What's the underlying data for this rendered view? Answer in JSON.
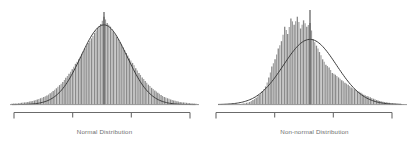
{
  "figure": {
    "background_color": "#ffffff",
    "bar_color": "#8a8a8a",
    "curve_color": "#3d3d3d",
    "axis_color": "#6b6b6b",
    "mean_line_color": "#4a4a4a",
    "caption_color": "#6e6e6e"
  },
  "panels": [
    {
      "id": "normal",
      "caption": "Normal Distribution",
      "axis": {
        "ticks": 2,
        "end_caps": true
      }
    },
    {
      "id": "non-normal",
      "caption": "Non-normal Distribution",
      "axis": {
        "ticks": 2,
        "end_caps": true
      }
    }
  ],
  "chart_data": [
    {
      "type": "bar",
      "title": "Normal Distribution",
      "xlabel": "",
      "ylabel": "",
      "grid": false,
      "legend": "none",
      "overlay_curve": "normal",
      "mean_line_x": 0,
      "xlim": [
        -4,
        4
      ],
      "ylim": [
        0,
        1
      ],
      "x": [
        -4.0,
        -3.86,
        -3.72,
        -3.59,
        -3.45,
        -3.31,
        -3.17,
        -3.03,
        -2.9,
        -2.76,
        -2.62,
        -2.48,
        -2.34,
        -2.21,
        -2.07,
        -1.93,
        -1.79,
        -1.66,
        -1.52,
        -1.38,
        -1.24,
        -1.1,
        -0.97,
        -0.83,
        -0.69,
        -0.55,
        -0.41,
        -0.28,
        -0.14,
        0.0,
        0.14,
        0.28,
        0.41,
        0.55,
        0.69,
        0.83,
        0.97,
        1.1,
        1.24,
        1.38,
        1.52,
        1.66,
        1.79,
        1.93,
        2.07,
        2.21,
        2.34,
        2.48,
        2.62,
        2.76,
        2.9,
        3.03,
        3.17,
        3.31,
        3.45,
        3.59,
        3.72,
        3.86,
        4.0
      ],
      "values": [
        0.01,
        0.012,
        0.015,
        0.02,
        0.024,
        0.03,
        0.037,
        0.046,
        0.056,
        0.07,
        0.085,
        0.1,
        0.125,
        0.15,
        0.18,
        0.215,
        0.25,
        0.295,
        0.34,
        0.39,
        0.45,
        0.5,
        0.56,
        0.62,
        0.68,
        0.73,
        0.79,
        0.85,
        0.89,
        0.97,
        0.9,
        0.86,
        0.8,
        0.75,
        0.69,
        0.63,
        0.57,
        0.51,
        0.46,
        0.4,
        0.35,
        0.3,
        0.26,
        0.22,
        0.185,
        0.155,
        0.13,
        0.105,
        0.085,
        0.07,
        0.056,
        0.046,
        0.037,
        0.03,
        0.024,
        0.02,
        0.016,
        0.013,
        0.01
      ],
      "curve": {
        "name": "fitted normal",
        "mean": 0.0,
        "sd": 1.0,
        "peak": 0.88
      }
    },
    {
      "type": "bar",
      "title": "Non-normal Distribution",
      "xlabel": "",
      "ylabel": "",
      "grid": false,
      "legend": "none",
      "overlay_curve": "normal",
      "mean_line_x": 0,
      "xlim": [
        -4,
        4
      ],
      "ylim": [
        0,
        1
      ],
      "x": [
        -4.0,
        -3.86,
        -3.72,
        -3.59,
        -3.45,
        -3.31,
        -3.17,
        -3.03,
        -2.9,
        -2.76,
        -2.62,
        -2.48,
        -2.34,
        -2.21,
        -2.07,
        -1.93,
        -1.79,
        -1.66,
        -1.52,
        -1.38,
        -1.24,
        -1.1,
        -0.97,
        -0.83,
        -0.69,
        -0.55,
        -0.41,
        -0.28,
        -0.14,
        0.0,
        0.14,
        0.28,
        0.41,
        0.55,
        0.69,
        0.83,
        0.97,
        1.1,
        1.24,
        1.38,
        1.52,
        1.66,
        1.79,
        1.93,
        2.07,
        2.21,
        2.34,
        2.48,
        2.62,
        2.76,
        2.9,
        3.03,
        3.17,
        3.31,
        3.45,
        3.59,
        3.72,
        3.86,
        4.0
      ],
      "values": [
        0.0,
        0.0,
        0.0,
        0.0,
        0.0,
        0.0,
        0.0,
        0.008,
        0.012,
        0.02,
        0.03,
        0.05,
        0.075,
        0.105,
        0.15,
        0.2,
        0.3,
        0.42,
        0.5,
        0.62,
        0.7,
        0.86,
        0.78,
        0.95,
        0.88,
        0.97,
        0.84,
        0.93,
        0.86,
        0.9,
        0.72,
        0.65,
        0.58,
        0.5,
        0.44,
        0.41,
        0.35,
        0.33,
        0.3,
        0.27,
        0.24,
        0.22,
        0.19,
        0.17,
        0.15,
        0.13,
        0.11,
        0.095,
        0.08,
        0.065,
        0.05,
        0.04,
        0.032,
        0.025,
        0.02,
        0.015,
        0.012,
        0.01,
        0.008
      ],
      "curve": {
        "name": "fitted normal",
        "mean": 0.0,
        "sd": 1.15,
        "peak": 0.72
      }
    }
  ]
}
